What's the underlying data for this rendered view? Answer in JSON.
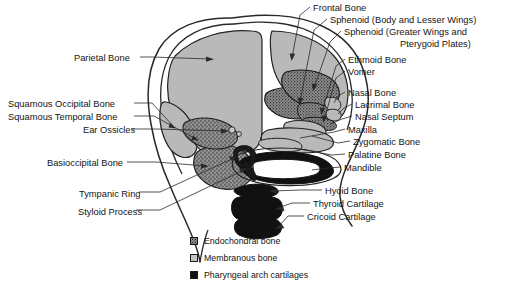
{
  "figure": {
    "background_color": "#ffffff",
    "line_color": "#1a1a1a"
  },
  "colors": {
    "membranous_bone": "#b9b9b9",
    "endochondral_bone": "#8d8d8d",
    "pharyngeal_cartilage": "#111111",
    "outline": "#1a1a1a",
    "text": "#141414"
  },
  "labels_left": [
    {
      "id": "parietal-bone",
      "text": "Parietal Bone",
      "x": 74,
      "y": 53
    },
    {
      "id": "squamous-occipital-bone",
      "text": "Squamous Occipital Bone",
      "x": 8,
      "y": 99
    },
    {
      "id": "squamous-temporal-bone",
      "text": "Squamous Temporal Bone",
      "x": 8,
      "y": 112
    },
    {
      "id": "ear-ossicles",
      "text": "Ear Ossicles",
      "x": 83,
      "y": 125
    },
    {
      "id": "basioccipital-bone",
      "text": "Basioccipital Bone",
      "x": 47,
      "y": 158
    },
    {
      "id": "tympanic-ring",
      "text": "Tympanic Ring",
      "x": 79,
      "y": 189
    },
    {
      "id": "styloid-process",
      "text": "Styloid Process",
      "x": 78,
      "y": 207
    }
  ],
  "labels_right": [
    {
      "id": "frontal-bone",
      "text": "Frontal Bone",
      "x": 313,
      "y": 3
    },
    {
      "id": "sphenoid-body-lesser-wings",
      "text": "Sphenoid (Body and Lesser Wings)",
      "x": 330,
      "y": 15
    },
    {
      "id": "sphenoid-greater-wings-pterygoid-1",
      "text": "Sphenoid (Greater Wings and",
      "x": 344,
      "y": 27
    },
    {
      "id": "sphenoid-greater-wings-pterygoid-2",
      "text": "Pterygoid Plates)",
      "x": 400,
      "y": 39
    },
    {
      "id": "ethmoid-bone",
      "text": "Ethmoid Bone",
      "x": 348,
      "y": 55
    },
    {
      "id": "vomer",
      "text": "Vomer",
      "x": 348,
      "y": 67
    },
    {
      "id": "nasal-bone",
      "text": "Nasal Bone",
      "x": 348,
      "y": 88
    },
    {
      "id": "lacrimal-bone",
      "text": "Lacrimal Bone",
      "x": 355,
      "y": 100
    },
    {
      "id": "nasal-septum",
      "text": "Nasal Septum",
      "x": 355,
      "y": 112
    },
    {
      "id": "maxilla",
      "text": "Maxilla",
      "x": 348,
      "y": 125
    },
    {
      "id": "zygomatic-bone",
      "text": "Zygomatic Bone",
      "x": 353,
      "y": 137
    },
    {
      "id": "palatine-bone",
      "text": "Palatine Bone",
      "x": 348,
      "y": 150
    },
    {
      "id": "mandible",
      "text": "Mandible",
      "x": 344,
      "y": 163
    },
    {
      "id": "hyoid-bone",
      "text": "Hyoid Bone",
      "x": 325,
      "y": 186
    },
    {
      "id": "thyroid-cartilage",
      "text": "Thyroid Cartilage",
      "x": 313,
      "y": 199
    },
    {
      "id": "cricoid-cartilage",
      "text": "Cricoid Cartilage",
      "x": 307,
      "y": 212
    }
  ],
  "legend": {
    "items": [
      {
        "id": "endochondral-bone",
        "label": "Endochondral bone",
        "swatch": "endochondral-swatch",
        "color": "#8d8d8d",
        "pattern": "stippled"
      },
      {
        "id": "membranous-bone",
        "label": "Membranous bone",
        "swatch": "membranous-swatch",
        "color": "#c3c3c3",
        "pattern": "solid-light"
      },
      {
        "id": "pharyngeal-arch-cartilages",
        "label": "Pharyngeal arch cartilages",
        "swatch": "pharyngeal-swatch",
        "color": "#111111",
        "pattern": "solid-black"
      }
    ]
  }
}
